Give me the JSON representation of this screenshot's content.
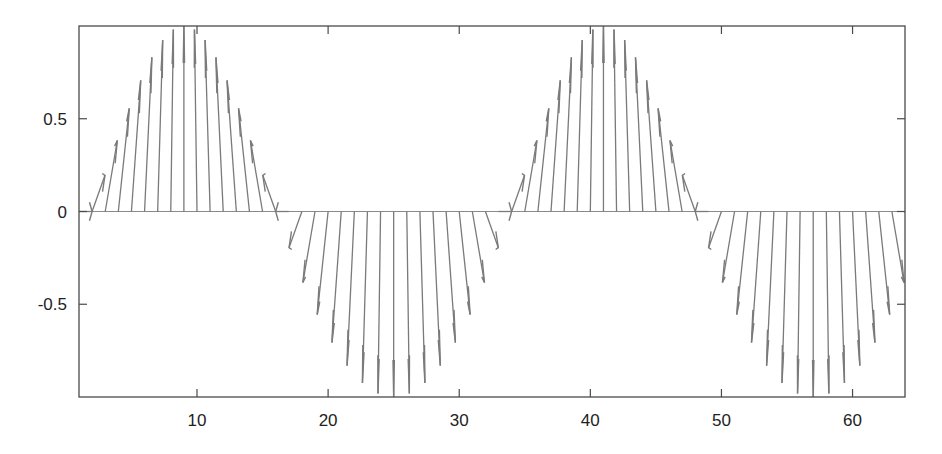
{
  "colors": {
    "arrow": "#7a7a7a",
    "baseline": "#8a8a8a",
    "frame": "#4a4a4a",
    "text": "#222222",
    "background": "#ffffff"
  },
  "chart_data": {
    "type": "feather",
    "title": "",
    "xlabel": "",
    "ylabel": "",
    "xlim": [
      1,
      64
    ],
    "ylim": [
      -1,
      1
    ],
    "grid": false,
    "legend": null,
    "xticks": [
      10,
      20,
      30,
      40,
      50,
      60
    ],
    "xtick_labels": [
      "10",
      "20",
      "30",
      "40",
      "50",
      "60"
    ],
    "yticks": [
      0.5,
      0,
      -0.5
    ],
    "ytick_labels": [
      "0.5",
      "0",
      "-0.5"
    ],
    "x": [
      1,
      2,
      3,
      4,
      5,
      6,
      7,
      8,
      9,
      10,
      11,
      12,
      13,
      14,
      15,
      16,
      17,
      18,
      19,
      20,
      21,
      22,
      23,
      24,
      25,
      26,
      27,
      28,
      29,
      30,
      31,
      32,
      33,
      34,
      35,
      36,
      37,
      38,
      39,
      40,
      41,
      42,
      43,
      44,
      45,
      46,
      47,
      48,
      49,
      50,
      51,
      52,
      53,
      54,
      55,
      56,
      57,
      58,
      59,
      60,
      61,
      62,
      63,
      64
    ],
    "u": [
      1,
      0.981,
      0.924,
      0.831,
      0.707,
      0.556,
      0.383,
      0.195,
      0,
      -0.195,
      -0.383,
      -0.556,
      -0.707,
      -0.831,
      -0.924,
      -0.981,
      -1,
      -0.981,
      -0.924,
      -0.831,
      -0.707,
      -0.556,
      -0.383,
      -0.195,
      0,
      0.195,
      0.383,
      0.556,
      0.707,
      0.831,
      0.924,
      0.981,
      1,
      0.981,
      0.924,
      0.831,
      0.707,
      0.556,
      0.383,
      0.195,
      0,
      -0.195,
      -0.383,
      -0.556,
      -0.707,
      -0.831,
      -0.924,
      -0.981,
      -1,
      -0.981,
      -0.924,
      -0.831,
      -0.707,
      -0.556,
      -0.383,
      -0.195,
      0,
      0.195,
      0.383,
      0.556,
      0.707,
      0.831,
      0.924,
      0.981
    ],
    "v": [
      0,
      0.195,
      0.383,
      0.556,
      0.707,
      0.831,
      0.924,
      0.981,
      1,
      0.981,
      0.924,
      0.831,
      0.707,
      0.556,
      0.383,
      0.195,
      0,
      -0.195,
      -0.383,
      -0.556,
      -0.707,
      -0.831,
      -0.924,
      -0.981,
      -1,
      -0.981,
      -0.924,
      -0.831,
      -0.707,
      -0.556,
      -0.383,
      -0.195,
      0,
      0.195,
      0.383,
      0.556,
      0.707,
      0.831,
      0.924,
      0.981,
      1,
      0.981,
      0.924,
      0.831,
      0.707,
      0.556,
      0.383,
      0.195,
      0,
      -0.195,
      -0.383,
      -0.556,
      -0.707,
      -0.831,
      -0.924,
      -0.981,
      -1,
      -0.981,
      -0.924,
      -0.831,
      -0.707,
      -0.556,
      -0.383,
      -0.195
    ]
  },
  "layout": {
    "plot_left": 79,
    "plot_right": 905,
    "plot_top": 26,
    "plot_bottom": 397
  }
}
